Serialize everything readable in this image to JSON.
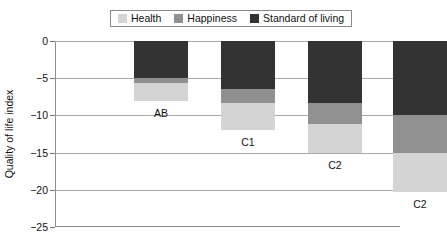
{
  "chart_data": {
    "type": "bar",
    "subtype": "stacked-bar-negative",
    "title": "",
    "subtitle": "",
    "xlabel": "",
    "ylabel": "Quality of life index",
    "ylim": [
      -25,
      0
    ],
    "yticks": [
      0,
      -5,
      -10,
      -15,
      -20,
      -25
    ],
    "ytick_labels": [
      "0",
      "−5",
      "−10",
      "−15",
      "−20",
      "−25"
    ],
    "grid": true,
    "legend_position": "top",
    "categories": [
      "AB",
      "C1",
      "C2",
      "C2"
    ],
    "series": [
      {
        "name": "Health",
        "color": "#d4d4d4",
        "values": [
          -2.4,
          -3.5,
          -3.9,
          -5.3
        ]
      },
      {
        "name": "Happiness",
        "color": "#909090",
        "values": [
          -0.6,
          -2.0,
          -2.7,
          -5.0
        ]
      },
      {
        "name": "Standard of living",
        "color": "#333333",
        "values": [
          -5.0,
          -6.4,
          -8.4,
          -10.0
        ]
      }
    ],
    "totals": [
      -8.0,
      -11.9,
      -15.0,
      -20.3
    ],
    "stack_order_from_zero": [
      "Standard of living",
      "Happiness",
      "Health"
    ]
  },
  "legend": {
    "items": [
      {
        "label": "Health",
        "color": "#d4d4d4"
      },
      {
        "label": "Happiness",
        "color": "#909090"
      },
      {
        "label": "Standard of living",
        "color": "#333333"
      }
    ]
  },
  "axis": {
    "y_title": "Quality of life index",
    "ticks": [
      {
        "value": 0,
        "label": "0"
      },
      {
        "value": -5,
        "label": "−5"
      },
      {
        "value": -10,
        "label": "−10"
      },
      {
        "value": -15,
        "label": "−15"
      },
      {
        "value": -20,
        "label": "−20"
      },
      {
        "value": -25,
        "label": "−25"
      }
    ]
  },
  "bars": [
    {
      "label": "AB",
      "total": -8.0,
      "segments": [
        {
          "series": "Standard of living",
          "from": 0,
          "to": -5.0
        },
        {
          "series": "Happiness",
          "from": -5.0,
          "to": -5.6
        },
        {
          "series": "Health",
          "from": -5.6,
          "to": -8.0
        }
      ]
    },
    {
      "label": "C1",
      "total": -11.9,
      "segments": [
        {
          "series": "Standard of living",
          "from": 0,
          "to": -6.4
        },
        {
          "series": "Happiness",
          "from": -6.4,
          "to": -8.4
        },
        {
          "series": "Health",
          "from": -8.4,
          "to": -11.9
        }
      ]
    },
    {
      "label": "C2",
      "total": -15.0,
      "segments": [
        {
          "series": "Standard of living",
          "from": 0,
          "to": -8.4
        },
        {
          "series": "Happiness",
          "from": -8.4,
          "to": -11.1
        },
        {
          "series": "Health",
          "from": -11.1,
          "to": -15.0
        }
      ]
    },
    {
      "label": "C2",
      "total": -20.3,
      "segments": [
        {
          "series": "Standard of living",
          "from": 0,
          "to": -10.0
        },
        {
          "series": "Happiness",
          "from": -10.0,
          "to": -15.0
        },
        {
          "series": "Health",
          "from": -15.0,
          "to": -20.3
        }
      ]
    }
  ],
  "layout": {
    "plot": {
      "left": 55,
      "top": 41,
      "width": 345,
      "height": 186
    },
    "bar_width": 54,
    "bar_centers": [
      106,
      193,
      280,
      365
    ],
    "label_offsets": [
      6,
      6,
      6,
      6
    ]
  }
}
